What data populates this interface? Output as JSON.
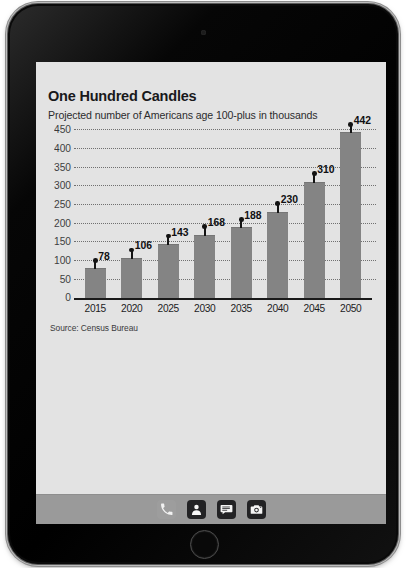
{
  "device": {
    "type": "tablet",
    "front_camera": "front-camera",
    "home_button": "home-button"
  },
  "chart_data": {
    "type": "bar",
    "title": "One Hundred Candles",
    "subtitle": "Projected number of Americans age 100-plus in thousands",
    "source": "Source: Census Bureau",
    "categories": [
      "2015",
      "2020",
      "2025",
      "2030",
      "2035",
      "2040",
      "2045",
      "2050"
    ],
    "values": [
      78,
      106,
      143,
      168,
      188,
      230,
      310,
      442
    ],
    "value_labels": [
      "78",
      "106",
      "143",
      "168",
      "188",
      "230",
      "310",
      "442"
    ],
    "xlabel": "",
    "ylabel": "",
    "ylim": [
      0,
      450
    ],
    "ytick_values": [
      0,
      50,
      100,
      150,
      200,
      250,
      300,
      350,
      400,
      450
    ],
    "ytick_labels": [
      "0",
      "50",
      "100",
      "150",
      "200",
      "250",
      "300",
      "350",
      "400",
      "450"
    ],
    "grid": true,
    "grid_style": "dotted-horizontal",
    "legend": false,
    "bar_color": "#848484",
    "marker_color": "#131313",
    "axis_color": "#1a1a1a",
    "background_color": "#e3e3e3"
  },
  "dock": {
    "items": [
      {
        "name": "phone-icon",
        "label": "Phone"
      },
      {
        "name": "contacts-icon",
        "label": "Contacts"
      },
      {
        "name": "messages-icon",
        "label": "Messages"
      },
      {
        "name": "camera-icon",
        "label": "Camera"
      }
    ]
  }
}
